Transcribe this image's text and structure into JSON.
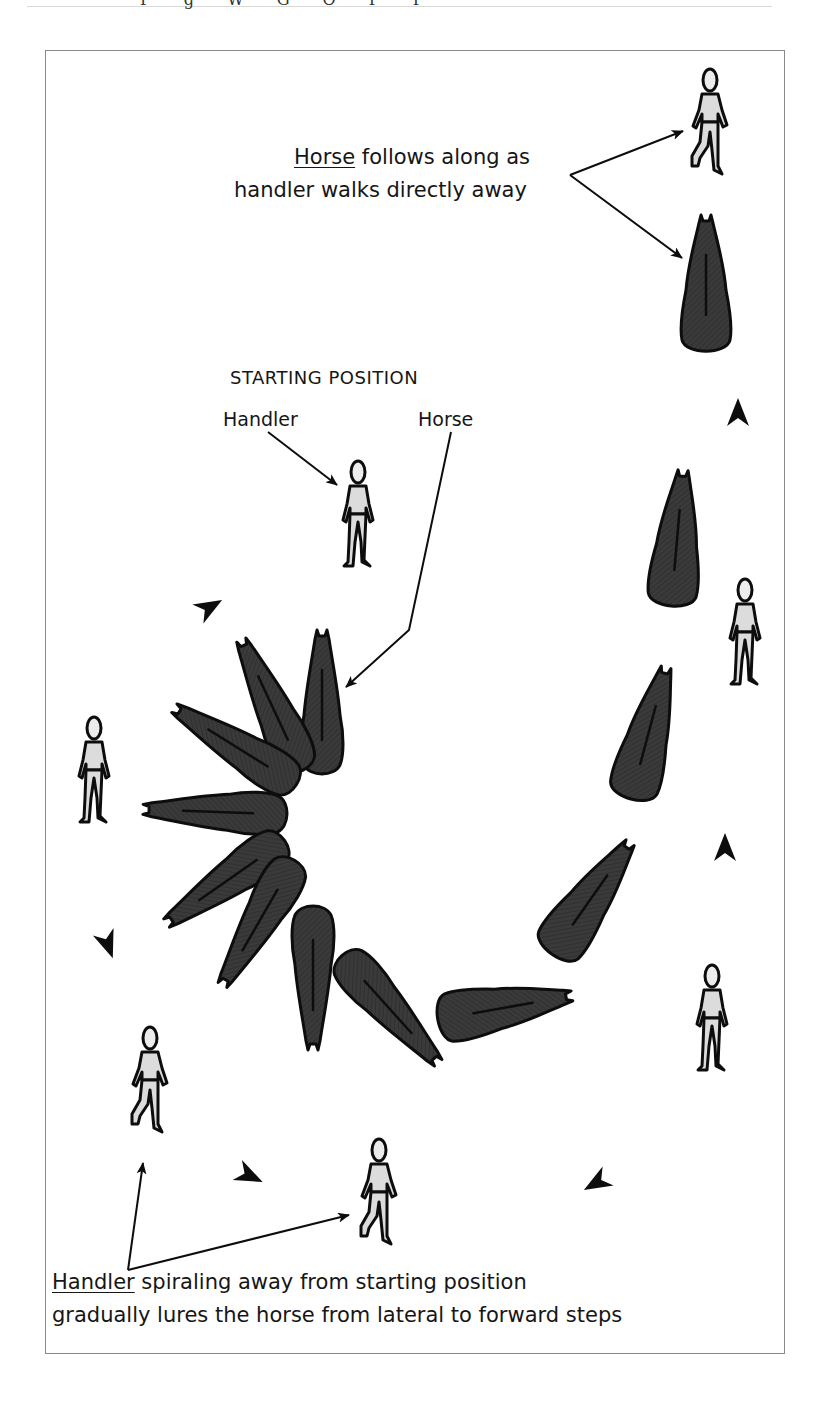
{
  "page": {
    "header_fragment": "P g W G O P P"
  },
  "diagram": {
    "title": "STARTING POSITION",
    "labels": {
      "handler": "Handler",
      "horse": "Horse"
    },
    "top_caption": {
      "underlined_word": "Horse",
      "line1_rest": " follows along as",
      "line2": "handler walks directly away"
    },
    "bottom_caption": {
      "underlined_word": "Handler",
      "line1_rest": " spiraling away from starting position",
      "line2": "gradually lures the horse from lateral to forward steps"
    },
    "colors": {
      "horse_fill": "#383838",
      "outline": "#0d0d0d",
      "handler_fill": "#dcdcdc",
      "frame": "#8a8a8a"
    },
    "figures": {
      "handlers": 8,
      "horses_starting_fan": 7,
      "horses_path": 6,
      "direction_arrowheads": 7
    }
  }
}
